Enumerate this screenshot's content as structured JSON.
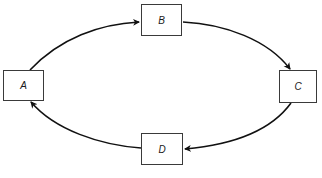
{
  "diagram": {
    "type": "cycle",
    "nodes": [
      {
        "id": "A",
        "label": "A"
      },
      {
        "id": "B",
        "label": "B"
      },
      {
        "id": "C",
        "label": "C"
      },
      {
        "id": "D",
        "label": "D"
      }
    ],
    "edges": [
      {
        "from": "A",
        "to": "B"
      },
      {
        "from": "B",
        "to": "C"
      },
      {
        "from": "C",
        "to": "D"
      },
      {
        "from": "D",
        "to": "A"
      }
    ]
  }
}
